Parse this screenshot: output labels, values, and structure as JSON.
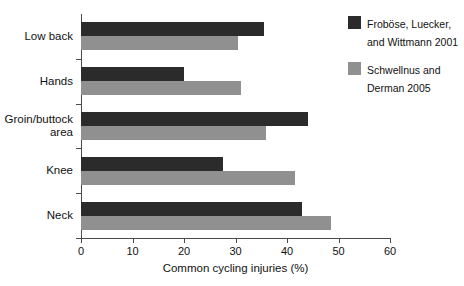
{
  "chart_data": {
    "type": "bar",
    "orientation": "horizontal",
    "title": "",
    "xlabel": "Common cycling injuries (%)",
    "ylabel": "",
    "xlim": [
      0,
      60
    ],
    "xticks": [
      0,
      10,
      20,
      30,
      40,
      50,
      60
    ],
    "grid": false,
    "legend_position": "right-top",
    "categories": [
      "Low back",
      "Hands",
      "Groin/buttock\narea",
      "Knee",
      "Neck"
    ],
    "series": [
      {
        "name": "Froböse, Luecker,\nand Wittmann 2001",
        "color": "#2b2b2b",
        "values": [
          35.5,
          20.0,
          44.0,
          27.5,
          43.0
        ]
      },
      {
        "name": "Schwellnus and\nDerman 2005",
        "color": "#909090",
        "values": [
          30.5,
          31.0,
          36.0,
          41.5,
          48.5
        ]
      }
    ]
  },
  "axis": {
    "tick_labels": [
      "0",
      "10",
      "20",
      "30",
      "40",
      "50",
      "60"
    ],
    "x_title": "Common cycling injuries (%)"
  },
  "legend": {
    "entries": [
      {
        "label": "Froböse, Luecker,\nand Wittmann 2001",
        "color": "#2b2b2b"
      },
      {
        "label": "Schwellnus and\nDerman 2005",
        "color": "#909090"
      }
    ]
  }
}
